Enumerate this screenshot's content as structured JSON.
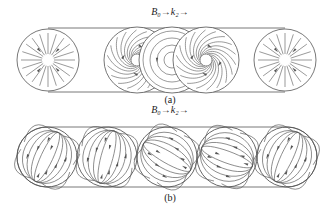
{
  "figure": {
    "panel_a": {
      "header": "B₀→k₂→",
      "caption": "(a)",
      "circles": [
        {
          "cx": 48,
          "cy": 60,
          "r": 31,
          "pattern": "radial-inward"
        },
        {
          "cx": 137,
          "cy": 60,
          "r": 33,
          "pattern": "spiral"
        },
        {
          "cx": 172,
          "cy": 60,
          "r": 33,
          "pattern": "concentric"
        },
        {
          "cx": 206,
          "cy": 60,
          "r": 33,
          "pattern": "spiral"
        },
        {
          "cx": 285,
          "cy": 60,
          "r": 31,
          "pattern": "radial-inward"
        }
      ],
      "tube": {
        "x1": 48,
        "x2": 285,
        "top": 28,
        "bottom": 92
      }
    },
    "panel_b": {
      "header": "B₀→k₂→",
      "caption": "(b)",
      "circles": [
        {
          "cx": 47,
          "cy": 157,
          "r": 30,
          "tilt": 25
        },
        {
          "cx": 107,
          "cy": 157,
          "r": 30,
          "tilt": 15
        },
        {
          "cx": 167,
          "cy": 157,
          "r": 30,
          "tilt": -60
        },
        {
          "cx": 227,
          "cy": 157,
          "r": 30,
          "tilt": -70
        },
        {
          "cx": 287,
          "cy": 157,
          "r": 30,
          "tilt": 25
        }
      ],
      "tube": {
        "x1": 47,
        "x2": 287,
        "top": 127,
        "bottom": 187
      }
    },
    "stroke_color": "#555555"
  }
}
